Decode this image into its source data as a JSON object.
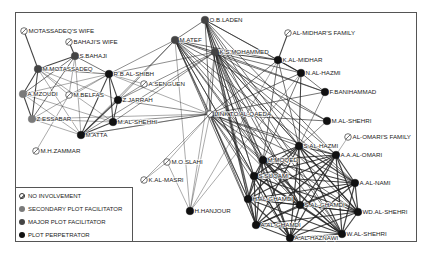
{
  "diagram": {
    "type": "network",
    "colors": {
      "none": "#ffffff",
      "secondary": "#7a7a7a",
      "major": "#444444",
      "perpetrator": "#111111",
      "edge": "#222222"
    },
    "nodes": [
      {
        "id": "motassadeq_wife",
        "label": "MOTASSADEQ'S WIFE",
        "type": "none",
        "x": 24,
        "y": 31
      },
      {
        "id": "bahaji_wife",
        "label": "BAHAJI'S WIFE",
        "type": "none",
        "x": 69,
        "y": 42
      },
      {
        "id": "s_bahaji",
        "label": "S.BAHAJI",
        "type": "major",
        "x": 75,
        "y": 56
      },
      {
        "id": "m_motassadeq",
        "label": "M.MOTASSADEQ",
        "type": "major",
        "x": 38,
        "y": 69
      },
      {
        "id": "r_b_al_shibh",
        "label": "R.B.AL-SHIBH",
        "type": "perpetrator",
        "x": 109,
        "y": 74
      },
      {
        "id": "a_mzoudi",
        "label": "A.MZOUDI",
        "type": "secondary",
        "x": 23,
        "y": 94
      },
      {
        "id": "m_belfas",
        "label": "M.BELFAS",
        "type": "none",
        "x": 69,
        "y": 95
      },
      {
        "id": "a_senguen",
        "label": "A.SENGUEN",
        "type": "none",
        "x": 144,
        "y": 84
      },
      {
        "id": "z_jarrah",
        "label": "Z.JARRAH",
        "type": "perpetrator",
        "x": 118,
        "y": 100
      },
      {
        "id": "m_al_shehhi",
        "label": "M.AL-SHEHHI",
        "type": "perpetrator",
        "x": 113,
        "y": 122
      },
      {
        "id": "z_essabar",
        "label": "Z.ESSABAR",
        "type": "secondary",
        "x": 32,
        "y": 119
      },
      {
        "id": "m_atta",
        "label": "M.ATTA",
        "type": "perpetrator",
        "x": 81,
        "y": 135
      },
      {
        "id": "m_h_zammar",
        "label": "M.H.ZAMMAR",
        "type": "none",
        "x": 36,
        "y": 151
      },
      {
        "id": "o_b_laden",
        "label": "O.B.LADEN",
        "type": "major",
        "x": 205,
        "y": 20
      },
      {
        "id": "m_atef",
        "label": "M.ATEF",
        "type": "major",
        "x": 175,
        "y": 40
      },
      {
        "id": "k_s_mohammed",
        "label": "K.S.MOHAMMED",
        "type": "major",
        "x": 215,
        "y": 52
      },
      {
        "id": "al_midhar_family",
        "label": "AL-MIDHAR'S FAMILY",
        "type": "none",
        "x": 288,
        "y": 33
      },
      {
        "id": "k_al_midhar",
        "label": "K.AL-MIDHAR",
        "type": "perpetrator",
        "x": 278,
        "y": 60
      },
      {
        "id": "n_al_hazmi",
        "label": "N.AL-HAZMI",
        "type": "perpetrator",
        "x": 301,
        "y": 73
      },
      {
        "id": "f_banihammad",
        "label": "F.BANIHAMMAD",
        "type": "perpetrator",
        "x": 325,
        "y": 92
      },
      {
        "id": "link_to_al_qaeda",
        "label": "LINK TO AL-QAEDA",
        "type": "none",
        "x": 210,
        "y": 114
      },
      {
        "id": "m_al_shehri",
        "label": "M.AL-SHEHRI",
        "type": "perpetrator",
        "x": 327,
        "y": 121
      },
      {
        "id": "al_omari_family",
        "label": "AL-OMARI'S FAMILY",
        "type": "none",
        "x": 348,
        "y": 137
      },
      {
        "id": "s_al_hazmi",
        "label": "S.AL-HAZMI",
        "type": "perpetrator",
        "x": 299,
        "y": 146
      },
      {
        "id": "a_a_al_omari",
        "label": "A.A.AL-OMARI",
        "type": "perpetrator",
        "x": 336,
        "y": 155
      },
      {
        "id": "m_moqed",
        "label": "M.MOQED",
        "type": "perpetrator",
        "x": 263,
        "y": 160
      },
      {
        "id": "s_suqami",
        "label": "S.SUQAMI",
        "type": "perpetrator",
        "x": 254,
        "y": 176
      },
      {
        "id": "a_al_nami",
        "label": "A.AL-NAMI",
        "type": "perpetrator",
        "x": 355,
        "y": 183
      },
      {
        "id": "h_al_ghamdi",
        "label": "H.AL-GHAMDI",
        "type": "perpetrator",
        "x": 248,
        "y": 199
      },
      {
        "id": "s_al_ghamdi",
        "label": "S.AL-GHAMDI",
        "type": "perpetrator",
        "x": 300,
        "y": 205
      },
      {
        "id": "wd_al_shehri",
        "label": "WD.AL-SHEHRI",
        "type": "perpetrator",
        "x": 358,
        "y": 212
      },
      {
        "id": "a_al_ghamdi",
        "label": "A.AL-GHAMDI",
        "type": "perpetrator",
        "x": 256,
        "y": 225
      },
      {
        "id": "w_al_shehri",
        "label": "W.AL-SHEHRI",
        "type": "perpetrator",
        "x": 342,
        "y": 234
      },
      {
        "id": "a_al_haznawi",
        "label": "A.AL-HAZNAWI",
        "type": "perpetrator",
        "x": 290,
        "y": 238
      },
      {
        "id": "m_o_slahi",
        "label": "M.O.SLAHI",
        "type": "none",
        "x": 167,
        "y": 162
      },
      {
        "id": "k_al_masri",
        "label": "K.AL-MASRI",
        "type": "none",
        "x": 144,
        "y": 180
      },
      {
        "id": "h_hanjour",
        "label": "H.HANJOUR",
        "type": "perpetrator",
        "x": 190,
        "y": 211
      }
    ],
    "edges": [
      [
        "motassadeq_wife",
        "m_motassadeq",
        1.4
      ],
      [
        "bahaji_wife",
        "s_bahaji",
        1.4
      ],
      [
        "s_bahaji",
        "m_motassadeq",
        1.4
      ],
      [
        "s_bahaji",
        "r_b_al_shibh",
        1
      ],
      [
        "s_bahaji",
        "a_mzoudi",
        1
      ],
      [
        "s_bahaji",
        "z_essabar",
        1
      ],
      [
        "s_bahaji",
        "m_atta",
        0.6
      ],
      [
        "m_motassadeq",
        "r_b_al_shibh",
        1
      ],
      [
        "m_motassadeq",
        "a_mzoudi",
        1.4
      ],
      [
        "m_motassadeq",
        "z_essabar",
        1.4
      ],
      [
        "m_motassadeq",
        "m_atta",
        0.6
      ],
      [
        "m_motassadeq",
        "m_al_shehhi",
        0.6
      ],
      [
        "m_motassadeq",
        "z_jarrah",
        0.6
      ],
      [
        "m_motassadeq",
        "m_belfas",
        0.6
      ],
      [
        "a_mzoudi",
        "z_essabar",
        1.4
      ],
      [
        "a_mzoudi",
        "r_b_al_shibh",
        0.6
      ],
      [
        "a_mzoudi",
        "m_atta",
        0.6
      ],
      [
        "a_mzoudi",
        "m_al_shehhi",
        0.6
      ],
      [
        "z_essabar",
        "m_atta",
        0.6
      ],
      [
        "z_essabar",
        "m_al_shehhi",
        0.6
      ],
      [
        "z_essabar",
        "r_b_al_shibh",
        0.6
      ],
      [
        "z_essabar",
        "link_to_al_qaeda",
        0.6
      ],
      [
        "m_belfas",
        "m_h_zammar",
        0.6
      ],
      [
        "m_belfas",
        "s_bahaji",
        0.6
      ],
      [
        "m_belfas",
        "r_b_al_shibh",
        0.6
      ],
      [
        "r_b_al_shibh",
        "z_jarrah",
        1.4
      ],
      [
        "r_b_al_shibh",
        "m_al_shehhi",
        1.4
      ],
      [
        "r_b_al_shibh",
        "m_atta",
        1.4
      ],
      [
        "r_b_al_shibh",
        "m_atef",
        0.8
      ],
      [
        "r_b_al_shibh",
        "k_s_mohammed",
        0.8
      ],
      [
        "r_b_al_shibh",
        "link_to_al_qaeda",
        0.6
      ],
      [
        "r_b_al_shibh",
        "a_senguen",
        0.6
      ],
      [
        "z_jarrah",
        "m_al_shehhi",
        1.4
      ],
      [
        "z_jarrah",
        "m_atta",
        1.4
      ],
      [
        "z_jarrah",
        "link_to_al_qaeda",
        0.8
      ],
      [
        "z_jarrah",
        "a_senguen",
        0.8
      ],
      [
        "z_jarrah",
        "k_s_mohammed",
        0.8
      ],
      [
        "z_jarrah",
        "m_atef",
        0.8
      ],
      [
        "m_al_shehhi",
        "m_atta",
        1.4
      ],
      [
        "m_al_shehhi",
        "link_to_al_qaeda",
        0.8
      ],
      [
        "m_al_shehhi",
        "k_s_mohammed",
        0.8
      ],
      [
        "m_atta",
        "link_to_al_qaeda",
        0.8
      ],
      [
        "m_atta",
        "k_s_mohammed",
        0.8
      ],
      [
        "m_atta",
        "m_atef",
        0.8
      ],
      [
        "o_b_laden",
        "m_atef",
        1
      ],
      [
        "o_b_laden",
        "k_s_mohammed",
        1
      ],
      [
        "o_b_laden",
        "link_to_al_qaeda",
        1
      ],
      [
        "o_b_laden",
        "s_al_hazmi",
        1
      ],
      [
        "o_b_laden",
        "m_moqed",
        1
      ],
      [
        "o_b_laden",
        "s_suqami",
        1
      ],
      [
        "o_b_laden",
        "h_al_ghamdi",
        1
      ],
      [
        "o_b_laden",
        "s_al_ghamdi",
        1
      ],
      [
        "o_b_laden",
        "a_al_ghamdi",
        1
      ],
      [
        "o_b_laden",
        "a_al_haznawi",
        1
      ],
      [
        "o_b_laden",
        "w_al_shehri",
        1
      ],
      [
        "o_b_laden",
        "k_al_midhar",
        1
      ],
      [
        "o_b_laden",
        "n_al_hazmi",
        1
      ],
      [
        "o_b_laden",
        "a_a_al_omari",
        1
      ],
      [
        "m_atef",
        "k_s_mohammed",
        1.2
      ],
      [
        "m_atef",
        "link_to_al_qaeda",
        1
      ],
      [
        "m_atef",
        "h_hanjour",
        0.6
      ],
      [
        "m_atef",
        "m_moqed",
        1
      ],
      [
        "m_atef",
        "s_suqami",
        1
      ],
      [
        "m_atef",
        "h_al_ghamdi",
        1
      ],
      [
        "m_atef",
        "a_al_ghamdi",
        1
      ],
      [
        "m_atef",
        "s_al_ghamdi",
        1
      ],
      [
        "m_atef",
        "a_al_haznawi",
        1
      ],
      [
        "m_atef",
        "w_al_shehri",
        1
      ],
      [
        "m_atef",
        "wd_al_shehri",
        1
      ],
      [
        "m_atef",
        "a_al_nami",
        1
      ],
      [
        "m_atef",
        "m_al_shehri",
        1
      ],
      [
        "m_atef",
        "k_al_midhar",
        1
      ],
      [
        "m_atef",
        "f_banihammad",
        1
      ],
      [
        "k_s_mohammed",
        "k_al_midhar",
        1.4
      ],
      [
        "k_s_mohammed",
        "n_al_hazmi",
        1
      ],
      [
        "k_s_mohammed",
        "f_banihammad",
        1
      ],
      [
        "k_s_mohammed",
        "m_al_shehri",
        1
      ],
      [
        "k_s_mohammed",
        "link_to_al_qaeda",
        1
      ],
      [
        "k_s_mohammed",
        "s_al_hazmi",
        1
      ],
      [
        "k_s_mohammed",
        "a_a_al_omari",
        1
      ],
      [
        "k_s_mohammed",
        "m_moqed",
        1
      ],
      [
        "k_s_mohammed",
        "s_suqami",
        1
      ],
      [
        "k_s_mohammed",
        "h_al_ghamdi",
        1
      ],
      [
        "k_s_mohammed",
        "a_al_ghamdi",
        1
      ],
      [
        "k_s_mohammed",
        "s_al_ghamdi",
        1
      ],
      [
        "k_s_mohammed",
        "a_al_haznawi",
        1
      ],
      [
        "k_s_mohammed",
        "w_al_shehri",
        1
      ],
      [
        "k_s_mohammed",
        "wd_al_shehri",
        1
      ],
      [
        "k_s_mohammed",
        "a_al_nami",
        1
      ],
      [
        "k_s_mohammed",
        "h_hanjour",
        0.6
      ],
      [
        "al_midhar_family",
        "k_al_midhar",
        1.4
      ],
      [
        "k_al_midhar",
        "n_al_hazmi",
        1.4
      ],
      [
        "k_al_midhar",
        "link_to_al_qaeda",
        1
      ],
      [
        "k_al_midhar",
        "s_al_hazmi",
        1
      ],
      [
        "k_al_midhar",
        "m_moqed",
        1
      ],
      [
        "k_al_midhar",
        "h_hanjour",
        0.6
      ],
      [
        "n_al_hazmi",
        "f_banihammad",
        1
      ],
      [
        "n_al_hazmi",
        "s_al_hazmi",
        1.4
      ],
      [
        "n_al_hazmi",
        "link_to_al_qaeda",
        1
      ],
      [
        "n_al_hazmi",
        "m_moqed",
        1
      ],
      [
        "n_al_hazmi",
        "h_hanjour",
        0.6
      ],
      [
        "f_banihammad",
        "link_to_al_qaeda",
        1
      ],
      [
        "f_banihammad",
        "s_al_hazmi",
        0.8
      ],
      [
        "m_al_shehri",
        "link_to_al_qaeda",
        1
      ],
      [
        "m_al_shehri",
        "s_al_hazmi",
        0.8
      ],
      [
        "link_to_al_qaeda",
        "m_o_slahi",
        0.6
      ],
      [
        "link_to_al_qaeda",
        "k_al_masri",
        0.6
      ],
      [
        "link_to_al_qaeda",
        "h_hanjour",
        0.6
      ],
      [
        "link_to_al_qaeda",
        "s_al_hazmi",
        1
      ],
      [
        "link_to_al_qaeda",
        "a_a_al_omari",
        1
      ],
      [
        "link_to_al_qaeda",
        "m_moqed",
        1
      ],
      [
        "link_to_al_qaeda",
        "s_suqami",
        1
      ],
      [
        "link_to_al_qaeda",
        "h_al_ghamdi",
        1
      ],
      [
        "link_to_al_qaeda",
        "a_al_ghamdi",
        1
      ],
      [
        "link_to_al_qaeda",
        "s_al_ghamdi",
        1
      ],
      [
        "link_to_al_qaeda",
        "a_al_haznawi",
        1
      ],
      [
        "link_to_al_qaeda",
        "w_al_shehri",
        1
      ],
      [
        "link_to_al_qaeda",
        "wd_al_shehri",
        1
      ],
      [
        "link_to_al_qaeda",
        "a_al_nami",
        1
      ],
      [
        "link_to_al_qaeda",
        "m_atta",
        0.6
      ],
      [
        "m_o_slahi",
        "k_al_masri",
        0.6
      ],
      [
        "h_hanjour",
        "m_o_slahi",
        0.6
      ],
      [
        "al_omari_family",
        "a_a_al_omari",
        0.6
      ],
      [
        "s_al_hazmi",
        "a_a_al_omari",
        1.6
      ],
      [
        "s_al_hazmi",
        "m_moqed",
        1.6
      ],
      [
        "s_al_hazmi",
        "s_suqami",
        1.6
      ],
      [
        "s_al_hazmi",
        "a_al_nami",
        1.6
      ],
      [
        "s_al_hazmi",
        "h_al_ghamdi",
        1.6
      ],
      [
        "s_al_hazmi",
        "s_al_ghamdi",
        1.6
      ],
      [
        "s_al_hazmi",
        "wd_al_shehri",
        1.6
      ],
      [
        "s_al_hazmi",
        "a_al_ghamdi",
        1.6
      ],
      [
        "s_al_hazmi",
        "w_al_shehri",
        1.6
      ],
      [
        "s_al_hazmi",
        "a_al_haznawi",
        1.6
      ],
      [
        "a_a_al_omari",
        "m_moqed",
        1.6
      ],
      [
        "a_a_al_omari",
        "s_suqami",
        1.6
      ],
      [
        "a_a_al_omari",
        "a_al_nami",
        1.6
      ],
      [
        "a_a_al_omari",
        "h_al_ghamdi",
        1.6
      ],
      [
        "a_a_al_omari",
        "s_al_ghamdi",
        1.6
      ],
      [
        "a_a_al_omari",
        "wd_al_shehri",
        1.6
      ],
      [
        "a_a_al_omari",
        "a_al_ghamdi",
        1.6
      ],
      [
        "a_a_al_omari",
        "w_al_shehri",
        1.6
      ],
      [
        "a_a_al_omari",
        "a_al_haznawi",
        1.6
      ],
      [
        "m_moqed",
        "s_suqami",
        1.6
      ],
      [
        "m_moqed",
        "a_al_nami",
        1.6
      ],
      [
        "m_moqed",
        "h_al_ghamdi",
        1.6
      ],
      [
        "m_moqed",
        "s_al_ghamdi",
        1.6
      ],
      [
        "m_moqed",
        "wd_al_shehri",
        1.6
      ],
      [
        "m_moqed",
        "a_al_ghamdi",
        1.6
      ],
      [
        "m_moqed",
        "w_al_shehri",
        1.6
      ],
      [
        "m_moqed",
        "a_al_haznawi",
        1.6
      ],
      [
        "s_suqami",
        "a_al_nami",
        1.6
      ],
      [
        "s_suqami",
        "h_al_ghamdi",
        1.6
      ],
      [
        "s_suqami",
        "s_al_ghamdi",
        1.6
      ],
      [
        "s_suqami",
        "wd_al_shehri",
        1.6
      ],
      [
        "s_suqami",
        "a_al_ghamdi",
        1.6
      ],
      [
        "s_suqami",
        "w_al_shehri",
        1.6
      ],
      [
        "s_suqami",
        "a_al_haznawi",
        1.6
      ],
      [
        "a_al_nami",
        "h_al_ghamdi",
        1.6
      ],
      [
        "a_al_nami",
        "s_al_ghamdi",
        1.6
      ],
      [
        "a_al_nami",
        "wd_al_shehri",
        1.6
      ],
      [
        "a_al_nami",
        "a_al_ghamdi",
        1.6
      ],
      [
        "a_al_nami",
        "w_al_shehri",
        1.6
      ],
      [
        "a_al_nami",
        "a_al_haznawi",
        1.6
      ],
      [
        "h_al_ghamdi",
        "s_al_ghamdi",
        1.6
      ],
      [
        "h_al_ghamdi",
        "wd_al_shehri",
        1.6
      ],
      [
        "h_al_ghamdi",
        "a_al_ghamdi",
        1.6
      ],
      [
        "h_al_ghamdi",
        "w_al_shehri",
        1.6
      ],
      [
        "h_al_ghamdi",
        "a_al_haznawi",
        1.6
      ],
      [
        "s_al_ghamdi",
        "wd_al_shehri",
        1.6
      ],
      [
        "s_al_ghamdi",
        "a_al_ghamdi",
        1.6
      ],
      [
        "s_al_ghamdi",
        "w_al_shehri",
        1.6
      ],
      [
        "s_al_ghamdi",
        "a_al_haznawi",
        1.6
      ],
      [
        "wd_al_shehri",
        "a_al_ghamdi",
        1.6
      ],
      [
        "wd_al_shehri",
        "w_al_shehri",
        1.6
      ],
      [
        "wd_al_shehri",
        "a_al_haznawi",
        1.6
      ],
      [
        "a_al_ghamdi",
        "w_al_shehri",
        1.6
      ],
      [
        "a_al_ghamdi",
        "a_al_haznawi",
        1.6
      ],
      [
        "w_al_shehri",
        "a_al_haznawi",
        1.6
      ]
    ]
  },
  "legend": {
    "items": [
      {
        "type": "none",
        "label": "NO INVOLVEMENT"
      },
      {
        "type": "secondary",
        "label": "SECONDARY PLOT FACILITATOR"
      },
      {
        "type": "major",
        "label": "MAJOR PLOT FACILITATOR"
      },
      {
        "type": "perpetrator",
        "label": "PLOT PERPETRATOR"
      }
    ]
  }
}
